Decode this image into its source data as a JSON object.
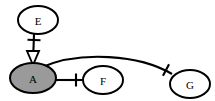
{
  "diagram": {
    "type": "node-link-graph",
    "width": 215,
    "height": 101,
    "background_color": "#ffffff",
    "stroke_color": "#000000",
    "nodes": [
      {
        "id": "E",
        "label": "E",
        "shape": "ellipse",
        "cx": 38,
        "cy": 20,
        "rx": 20,
        "ry": 14,
        "fill": "#ffffff",
        "stroke": "#000000",
        "filled": false
      },
      {
        "id": "A",
        "label": "A",
        "shape": "ellipse",
        "cx": 33,
        "cy": 78,
        "rx": 23,
        "ry": 15,
        "fill": "#9a9a9a",
        "stroke": "#000000",
        "filled": true
      },
      {
        "id": "F",
        "label": "F",
        "shape": "ellipse",
        "cx": 103,
        "cy": 80,
        "rx": 20,
        "ry": 14,
        "fill": "#ffffff",
        "stroke": "#000000",
        "filled": false
      },
      {
        "id": "G",
        "label": "G",
        "shape": "ellipse",
        "cx": 190,
        "cy": 84,
        "rx": 20,
        "ry": 14,
        "fill": "#ffffff",
        "stroke": "#000000",
        "filled": true
      }
    ],
    "edges": [
      {
        "id": "E-A",
        "from": "E",
        "to": "A",
        "path": "M 34 34 L 33 63",
        "curved": false,
        "tick": {
          "cx": 34,
          "cy": 40,
          "angle": 92,
          "length": 13
        },
        "arrowhead": {
          "at": "A",
          "style": "hollow-triangle",
          "apex_x": 33,
          "apex_y": 65,
          "width": 12,
          "height": 14
        }
      },
      {
        "id": "A-F",
        "from": "A",
        "to": "F",
        "path": "M 52 80 L 83 80",
        "curved": false,
        "tick": {
          "cx": 76,
          "cy": 80,
          "angle": 0,
          "length": 13
        },
        "arrowhead": null
      },
      {
        "id": "A-G",
        "from": "A",
        "to": "G",
        "path": "M 40 68 C 80 50, 140 55, 172 74",
        "curved": true,
        "tick": {
          "cx": 166,
          "cy": 70,
          "angle": 28,
          "length": 13
        },
        "arrowhead": null
      }
    ],
    "icon_names": [
      "ellipse-node-icon",
      "hollow-triangle-arrowhead-icon",
      "edge-tick-icon"
    ]
  }
}
